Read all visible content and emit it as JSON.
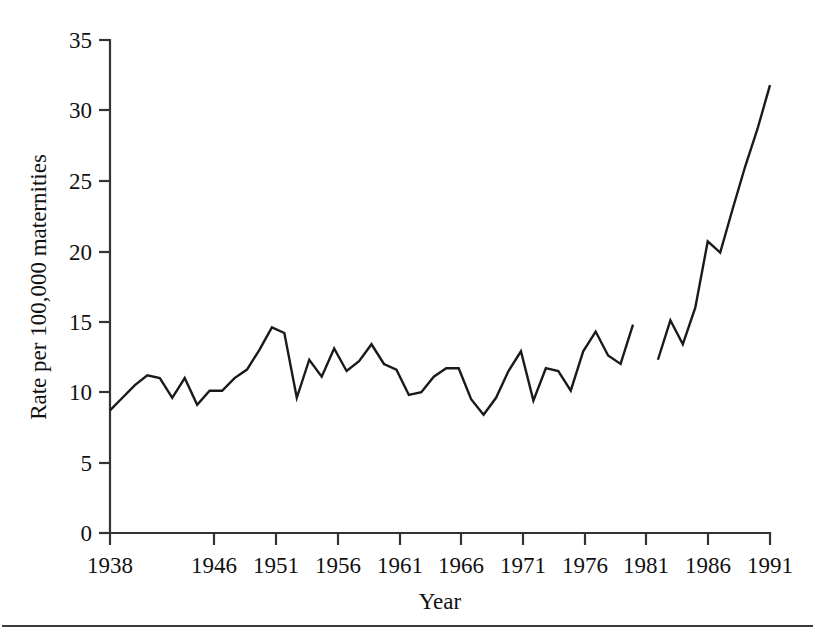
{
  "chart_data": {
    "type": "line",
    "title": "",
    "xlabel": "Year",
    "ylabel": "Rate per 100,000 maternities",
    "xlim": [
      1938,
      1991
    ],
    "ylim": [
      0,
      35
    ],
    "grid": false,
    "legend": null,
    "x_ticks": [
      1938,
      1946,
      1951,
      1956,
      1961,
      1966,
      1971,
      1976,
      1981,
      1986,
      1991
    ],
    "x_tick_labels": [
      "1938",
      "1946",
      "1951",
      "1956",
      "1961",
      "1966",
      "1971",
      "1976",
      "1981",
      "1986",
      "1991"
    ],
    "y_ticks": [
      0,
      5,
      10,
      15,
      20,
      25,
      30,
      35
    ],
    "y_tick_labels": [
      "0",
      "5",
      "10",
      "15",
      "20",
      "25",
      "30",
      "35"
    ],
    "note": "Line is drawn as two separate segments with a break between 1980 and 1982",
    "series": [
      {
        "name": "segment-1",
        "x": [
          1938,
          1939,
          1940,
          1941,
          1942,
          1943,
          1944,
          1945,
          1946,
          1947,
          1948,
          1949,
          1950,
          1951,
          1952,
          1953,
          1954,
          1955,
          1956,
          1957,
          1958,
          1959,
          1960,
          1961,
          1962,
          1963,
          1964,
          1965,
          1966,
          1967,
          1968,
          1969,
          1970,
          1971,
          1972,
          1973,
          1974,
          1975,
          1976,
          1977,
          1978,
          1979,
          1980
        ],
        "values": [
          8.7,
          9.6,
          10.5,
          11.2,
          11.0,
          9.6,
          11.0,
          9.1,
          10.1,
          10.1,
          11.0,
          11.6,
          13.0,
          14.6,
          14.2,
          9.6,
          12.3,
          11.1,
          13.1,
          11.5,
          12.2,
          13.4,
          12.0,
          11.6,
          9.8,
          10.0,
          11.1,
          11.7,
          11.7,
          9.5,
          8.4,
          9.6,
          11.5,
          12.9,
          9.4,
          11.7,
          11.5,
          10.1,
          12.9,
          14.3,
          12.6,
          12.0,
          14.8
        ]
      },
      {
        "name": "segment-2",
        "x": [
          1982,
          1983,
          1984,
          1985,
          1986,
          1987,
          1988,
          1989,
          1990,
          1991
        ],
        "values": [
          12.3,
          15.1,
          13.4,
          16.0,
          20.7,
          19.9,
          23.0,
          26.0,
          28.7,
          31.8
        ]
      }
    ]
  },
  "figure": {
    "caption": ""
  }
}
